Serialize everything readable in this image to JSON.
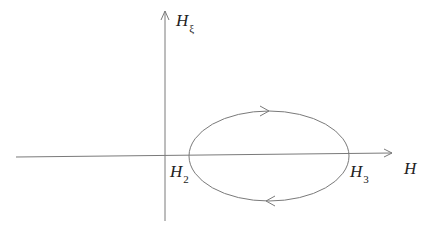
{
  "diagram": {
    "type": "phase-plane loop",
    "axes": {
      "x_label": "H",
      "y_label_base": "H",
      "y_label_sub": "ξ"
    },
    "points": [
      {
        "label_base": "H",
        "label_sub": "2"
      },
      {
        "label_base": "H",
        "label_sub": "3"
      }
    ],
    "loop": {
      "direction": "clockwise",
      "description": "closed orbit crossing H axis at H2 and H3"
    },
    "colors": {
      "line": "#7a7a7a",
      "text": "#222222"
    }
  }
}
